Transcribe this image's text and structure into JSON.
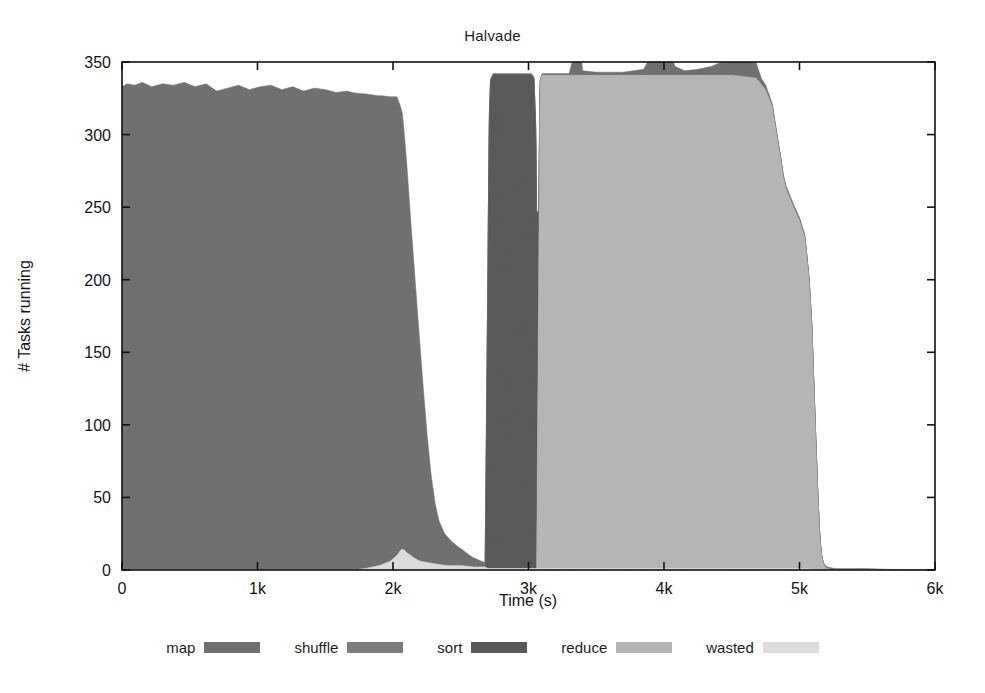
{
  "chart_data": {
    "type": "area",
    "title": "Halvade",
    "xlabel": "Time (s)",
    "ylabel": "# Tasks running",
    "xlim": [
      0,
      6000
    ],
    "ylim": [
      0,
      350
    ],
    "grid": false,
    "stacked": true,
    "legend_position": "bottom",
    "xticks": [
      0,
      1000,
      2000,
      3000,
      4000,
      5000,
      6000
    ],
    "xticklabels": [
      "0",
      "1k",
      "2k",
      "3k",
      "4k",
      "5k",
      "6k"
    ],
    "yticks": [
      0,
      50,
      100,
      150,
      200,
      250,
      300,
      350
    ],
    "yticklabels": [
      "0",
      "50",
      "100",
      "150",
      "200",
      "250",
      "300",
      "350"
    ],
    "series": [
      {
        "name": "map",
        "color": "#6f6f6f",
        "points": [
          [
            0,
            333
          ],
          [
            40,
            335
          ],
          [
            90,
            334
          ],
          [
            150,
            336
          ],
          [
            220,
            333
          ],
          [
            300,
            335
          ],
          [
            380,
            334
          ],
          [
            460,
            336
          ],
          [
            540,
            333
          ],
          [
            620,
            335
          ],
          [
            700,
            330
          ],
          [
            780,
            332
          ],
          [
            860,
            334
          ],
          [
            940,
            331
          ],
          [
            1020,
            333
          ],
          [
            1100,
            334
          ],
          [
            1180,
            331
          ],
          [
            1260,
            333
          ],
          [
            1340,
            330
          ],
          [
            1420,
            332
          ],
          [
            1500,
            331
          ],
          [
            1580,
            329
          ],
          [
            1660,
            330
          ],
          [
            1740,
            328
          ],
          [
            1800,
            327
          ],
          [
            1860,
            325
          ],
          [
            1920,
            323
          ],
          [
            1980,
            320
          ],
          [
            2030,
            316
          ],
          [
            2070,
            300
          ],
          [
            2100,
            270
          ],
          [
            2130,
            232
          ],
          [
            2160,
            196
          ],
          [
            2190,
            160
          ],
          [
            2220,
            124
          ],
          [
            2250,
            90
          ],
          [
            2280,
            62
          ],
          [
            2310,
            42
          ],
          [
            2340,
            30
          ],
          [
            2380,
            22
          ],
          [
            2430,
            17
          ],
          [
            2480,
            13
          ],
          [
            2530,
            10
          ],
          [
            2580,
            7
          ],
          [
            2630,
            5
          ],
          [
            2680,
            3
          ],
          [
            2700,
            2
          ],
          [
            2750,
            1
          ],
          [
            2800,
            1
          ],
          [
            3000,
            1
          ],
          [
            3300,
            1
          ],
          [
            3330,
            12
          ],
          [
            3345,
            120
          ],
          [
            3355,
            247
          ],
          [
            3365,
            130
          ],
          [
            3380,
            20
          ],
          [
            3400,
            3
          ],
          [
            3500,
            2
          ],
          [
            3700,
            2
          ],
          [
            3850,
            4
          ],
          [
            3930,
            18
          ],
          [
            3970,
            55
          ],
          [
            3995,
            104
          ],
          [
            4010,
            60
          ],
          [
            4040,
            20
          ],
          [
            4080,
            6
          ],
          [
            4150,
            3
          ],
          [
            4250,
            4
          ],
          [
            4350,
            6
          ],
          [
            4450,
            10
          ],
          [
            4520,
            22
          ],
          [
            4570,
            38
          ],
          [
            4600,
            41
          ],
          [
            4630,
            30
          ],
          [
            4670,
            12
          ],
          [
            4720,
            4
          ],
          [
            4800,
            2
          ],
          [
            4950,
            2
          ],
          [
            5100,
            2
          ],
          [
            5200,
            1
          ],
          [
            5300,
            1
          ],
          [
            5500,
            1
          ],
          [
            5800,
            0
          ],
          [
            6000,
            0
          ]
        ]
      },
      {
        "name": "shuffle",
        "color": "#7c7c7c",
        "points": [
          [
            0,
            0
          ],
          [
            2000,
            0
          ],
          [
            2600,
            0
          ],
          [
            2680,
            0
          ],
          [
            3000,
            0
          ],
          [
            6000,
            0
          ]
        ]
      },
      {
        "name": "sort",
        "color": "#585858",
        "points": [
          [
            0,
            0
          ],
          [
            2680,
            0
          ],
          [
            2700,
            200
          ],
          [
            2710,
            310
          ],
          [
            2720,
            336
          ],
          [
            2740,
            340
          ],
          [
            2800,
            340
          ],
          [
            2900,
            340
          ],
          [
            3000,
            340
          ],
          [
            3020,
            340
          ],
          [
            3040,
            338
          ],
          [
            3055,
            300
          ],
          [
            3065,
            180
          ],
          [
            3075,
            40
          ],
          [
            3085,
            0
          ],
          [
            3200,
            0
          ],
          [
            6000,
            0
          ]
        ]
      },
      {
        "name": "reduce",
        "color": "#b5b5b5",
        "points": [
          [
            0,
            0
          ],
          [
            3060,
            0
          ],
          [
            3075,
            200
          ],
          [
            3085,
            336
          ],
          [
            3100,
            340
          ],
          [
            3300,
            340
          ],
          [
            3500,
            340
          ],
          [
            3700,
            340
          ],
          [
            3900,
            340
          ],
          [
            4100,
            340
          ],
          [
            4300,
            340
          ],
          [
            4500,
            340
          ],
          [
            4600,
            339
          ],
          [
            4680,
            338
          ],
          [
            4750,
            330
          ],
          [
            4800,
            318
          ],
          [
            4830,
            300
          ],
          [
            4860,
            283
          ],
          [
            4880,
            270
          ],
          [
            4900,
            262
          ],
          [
            4930,
            255
          ],
          [
            4960,
            248
          ],
          [
            5000,
            240
          ],
          [
            5040,
            228
          ],
          [
            5070,
            200
          ],
          [
            5090,
            170
          ],
          [
            5105,
            130
          ],
          [
            5120,
            90
          ],
          [
            5135,
            52
          ],
          [
            5150,
            22
          ],
          [
            5165,
            8
          ],
          [
            5180,
            3
          ],
          [
            5200,
            1
          ],
          [
            5250,
            0
          ],
          [
            5400,
            0
          ],
          [
            6000,
            0
          ]
        ]
      },
      {
        "name": "wasted",
        "color": "#dcdcdc",
        "points": [
          [
            0,
            0
          ],
          [
            1700,
            0
          ],
          [
            1800,
            1
          ],
          [
            1900,
            3
          ],
          [
            1980,
            6
          ],
          [
            2030,
            10
          ],
          [
            2060,
            14
          ],
          [
            2080,
            14
          ],
          [
            2100,
            12
          ],
          [
            2130,
            10
          ],
          [
            2160,
            8
          ],
          [
            2200,
            6
          ],
          [
            2260,
            5
          ],
          [
            2320,
            4
          ],
          [
            2400,
            3
          ],
          [
            2500,
            3
          ],
          [
            2600,
            2
          ],
          [
            2680,
            2
          ],
          [
            2700,
            1
          ],
          [
            3000,
            1
          ],
          [
            3500,
            1
          ],
          [
            4000,
            1
          ],
          [
            4500,
            1
          ],
          [
            5000,
            1
          ],
          [
            5300,
            0
          ],
          [
            6000,
            0
          ]
        ]
      }
    ],
    "annotations": {
      "map_plateau_value": 334,
      "sort_reduce_plateau_value": 340,
      "spike_peaks": [
        {
          "time": 3355,
          "value": 247
        },
        {
          "time": 3995,
          "value": 104
        },
        {
          "time": 4600,
          "value": 41
        }
      ],
      "reduce_end_time": 5200
    }
  },
  "legend": {
    "items": [
      {
        "label": "map",
        "color": "#6f6f6f"
      },
      {
        "label": "shuffle",
        "color": "#7c7c7c"
      },
      {
        "label": "sort",
        "color": "#585858"
      },
      {
        "label": "reduce",
        "color": "#b5b5b5"
      },
      {
        "label": "wasted",
        "color": "#dcdcdc"
      }
    ]
  },
  "colors": {
    "axis": "#111111",
    "background": "#ffffff",
    "text": "#1a1a1a"
  }
}
